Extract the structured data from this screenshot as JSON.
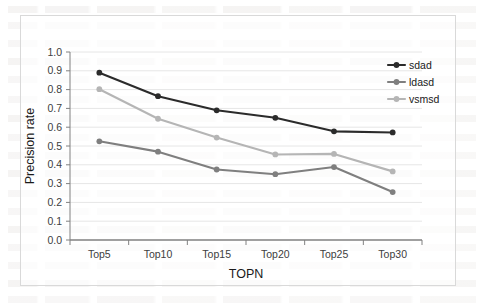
{
  "chart_data": {
    "type": "line",
    "title": "",
    "xlabel": "TOPN",
    "ylabel": "Precision rate",
    "categories": [
      "Top5",
      "Top10",
      "Top15",
      "Top20",
      "Top25",
      "Top30"
    ],
    "ylim": [
      0.0,
      1.0
    ],
    "ytick_labels": [
      "0.0",
      "0.1",
      "0.2",
      "0.3",
      "0.4",
      "0.5",
      "0.6",
      "0.7",
      "0.8",
      "0.9",
      "1.0"
    ],
    "ytick_values": [
      0.0,
      0.1,
      0.2,
      0.3,
      0.4,
      0.5,
      0.6,
      0.7,
      0.8,
      0.9,
      1.0
    ],
    "grid": true,
    "grid_axis": "y",
    "legend_position": "top-right",
    "marker": "circle",
    "series": [
      {
        "name": "sdad",
        "color": "#2b2b2b",
        "values": [
          0.89,
          0.765,
          0.69,
          0.65,
          0.578,
          0.572
        ]
      },
      {
        "name": "ldasd",
        "color": "#7f7f7f",
        "values": [
          0.525,
          0.47,
          0.375,
          0.35,
          0.388,
          0.255
        ]
      },
      {
        "name": "vsmsd",
        "color": "#b5b5b5",
        "values": [
          0.802,
          0.645,
          0.545,
          0.455,
          0.458,
          0.365
        ]
      }
    ]
  },
  "colors": {
    "frame_border": "#d9d9d9",
    "axis_line": "#808080",
    "gridline": "#e6e6e6",
    "tick_text": "#404040",
    "background": "#ffffff"
  }
}
